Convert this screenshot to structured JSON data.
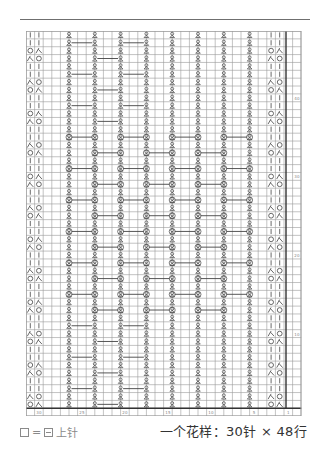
{
  "chart": {
    "stitch_columns": 30,
    "total_columns": 32,
    "rows": 48,
    "col_width": 8.6,
    "row_height": 7.86,
    "line_color": "#9a9a9a",
    "bold_line_color": "#333333",
    "symbol_color": "#444444",
    "twist_columns": [
      4,
      7,
      10,
      13,
      16,
      19,
      22,
      25
    ],
    "edge_columns_left": [
      0,
      1
    ],
    "edge_columns_right": [
      28,
      29
    ],
    "edge_pattern_left": [
      "|",
      "|",
      "O",
      "入",
      "|",
      "|",
      "入",
      "O"
    ],
    "edge_pattern_right": [
      "|",
      "|",
      "O",
      "入",
      "|",
      "|",
      "入",
      "O"
    ],
    "row_number_labels": [
      "10",
      "20",
      "30",
      "40"
    ],
    "column_number_labels": [
      "30",
      "25",
      "20",
      "15",
      "10",
      "5",
      "1"
    ]
  },
  "legend": {
    "equals": "=",
    "label": "上针"
  },
  "summary": {
    "text": "一个花样：30针 × 48行"
  }
}
